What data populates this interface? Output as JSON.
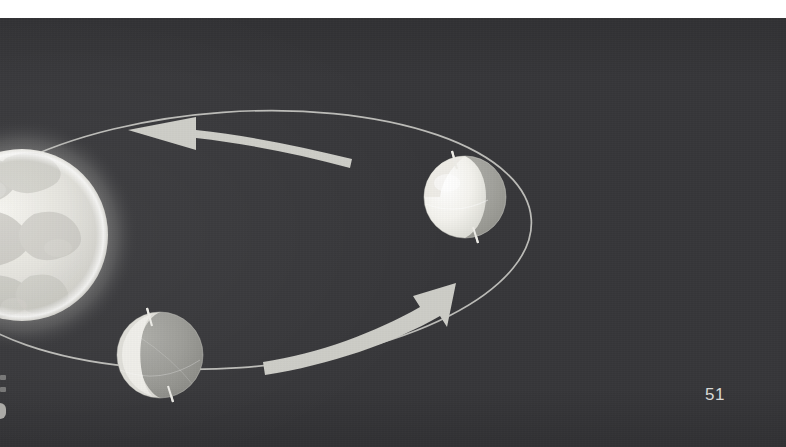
{
  "page": {
    "number": "51",
    "background_color": "#37373a",
    "margin_color": "#ffffff",
    "kind": "textbook-figure-plate"
  },
  "figure": {
    "title": "",
    "caption": "",
    "colors": {
      "plate_background": "#37373a",
      "lit_surface": "#f2f1ec",
      "shadowed_surface": "#9b9b97",
      "orbit_line": "#c9c9c4",
      "arrow_fill": "#cfcfc9",
      "glow": "#e8e7e2",
      "page_number_text": "#d9d9d6"
    },
    "elements": [
      {
        "name": "illuminated-body",
        "label": "",
        "type": "glowing-sphere",
        "center_x": 22,
        "center_y": 217,
        "radius": 86,
        "glow": true,
        "surface": "mottled-maria"
      },
      {
        "name": "orbit-path",
        "label": "",
        "type": "ellipse",
        "center_x": 232,
        "center_y": 222,
        "radius_x": 300,
        "radius_y": 128,
        "rotation_deg": -4,
        "stroke_width": 1.6
      },
      {
        "name": "sphere-upper-right",
        "label": "",
        "type": "phase-sphere",
        "center_x": 465,
        "center_y": 179,
        "radius": 41,
        "lit_fraction": 0.55,
        "lit_side": "left",
        "axis_tilt_deg": 18
      },
      {
        "name": "sphere-lower-left",
        "label": "",
        "type": "phase-sphere",
        "center_x": 160,
        "center_y": 337,
        "radius": 43,
        "lit_fraction": 0.2,
        "lit_side": "left",
        "axis_tilt_deg": 18
      },
      {
        "name": "orbit-arrow-top",
        "label": "",
        "type": "curved-arrow",
        "direction": "left",
        "start_x": 352,
        "start_y": 137,
        "end_x": 128,
        "end_y": 110
      },
      {
        "name": "orbit-arrow-bottom",
        "label": "",
        "type": "curved-arrow",
        "direction": "up-right",
        "start_x": 262,
        "start_y": 334,
        "end_x": 452,
        "end_y": 267
      }
    ],
    "edge_marks": [
      {
        "name": "edge-mark-1",
        "y": 17
      },
      {
        "name": "edge-mark-2",
        "y": 29
      },
      {
        "name": "edge-mark-3",
        "y": 45
      }
    ]
  }
}
